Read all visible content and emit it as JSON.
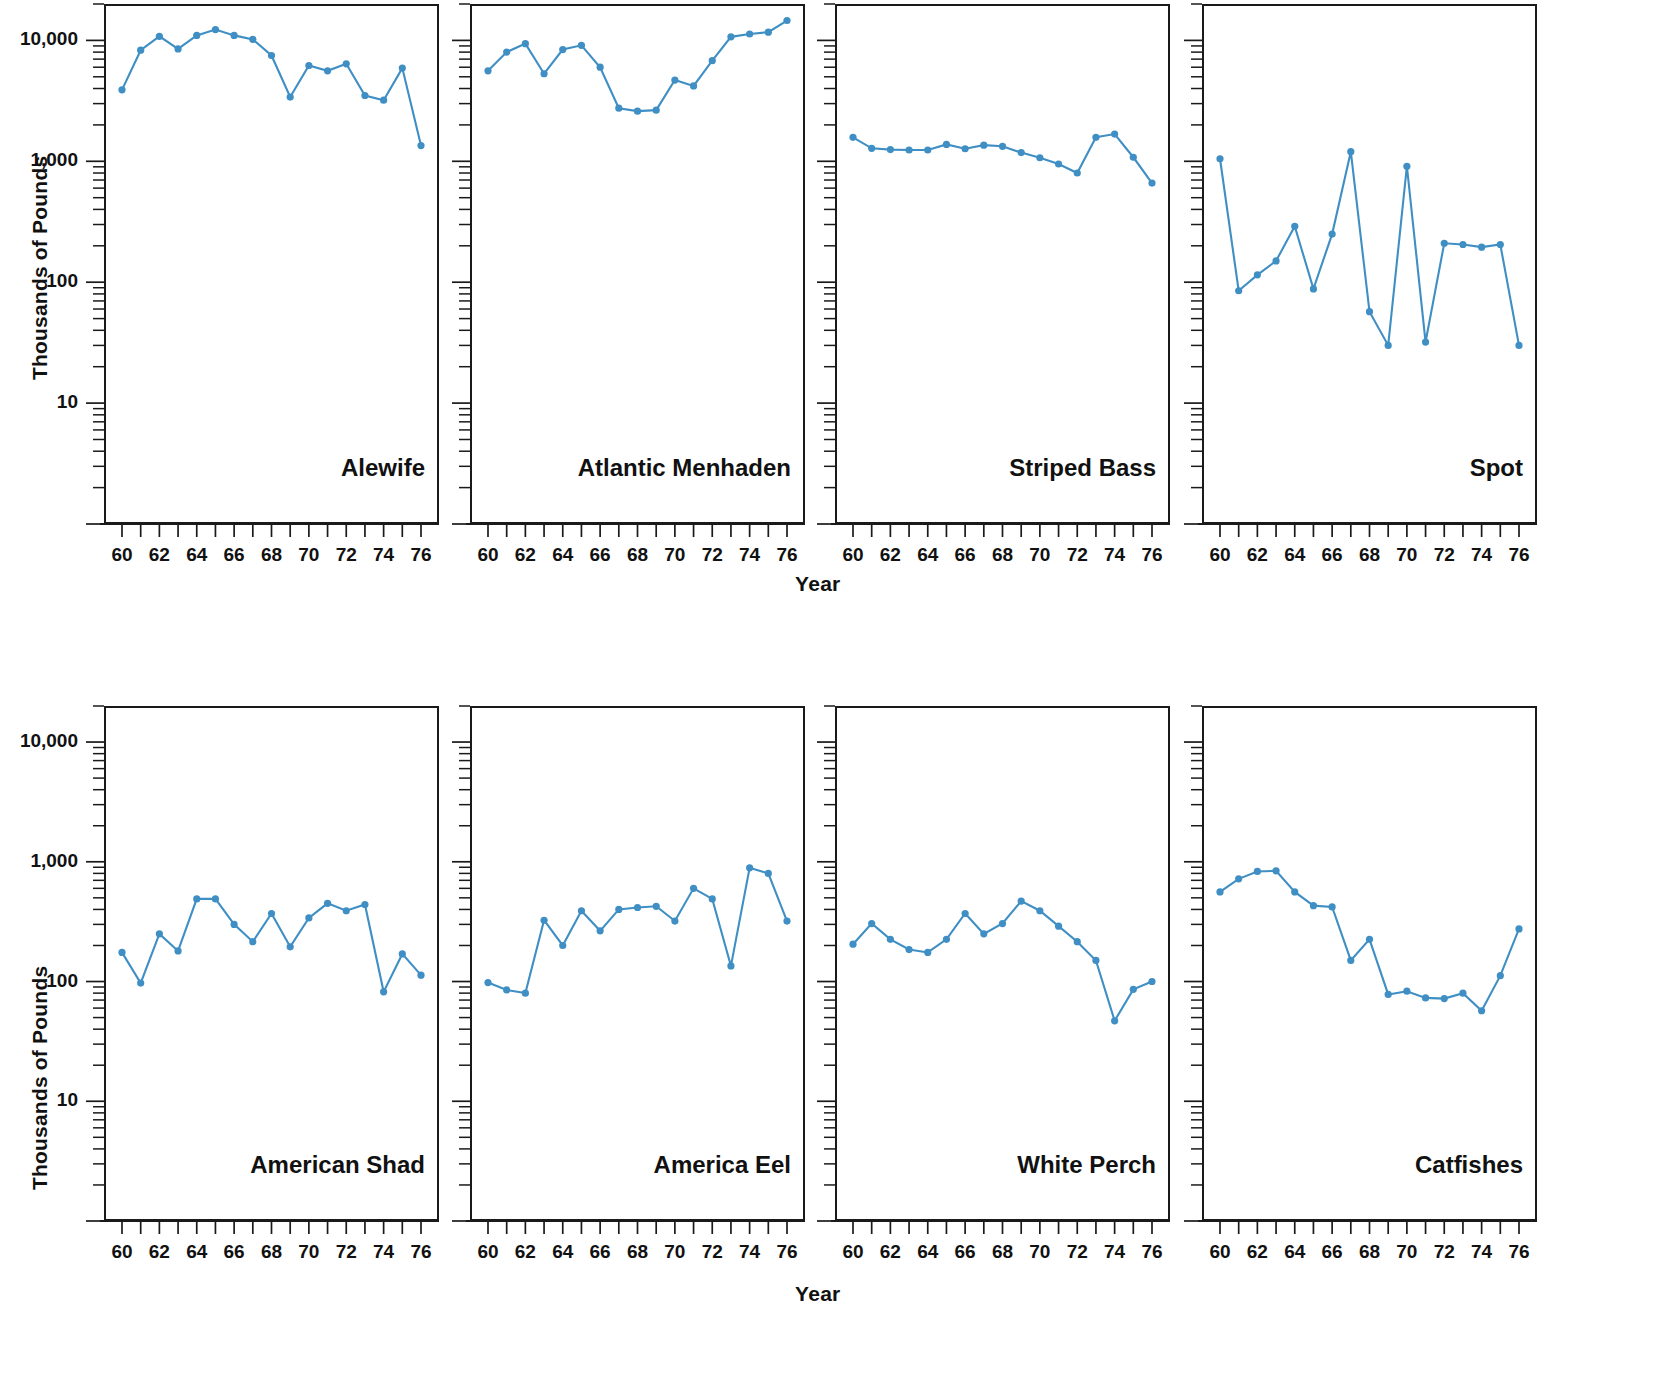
{
  "figure": {
    "ylabel": "Thousands of Pounds",
    "xlabel": "Year",
    "accent_color": "#3f8fc4",
    "axis_color": "#1a1a1a",
    "background": "#ffffff"
  },
  "axes": {
    "y_major_labels": [
      "10,000",
      "1,000",
      "100",
      "10"
    ],
    "y_major_values": [
      10000,
      1000,
      100,
      10
    ],
    "y_scale": "log",
    "y_min": 1,
    "y_max": 20000,
    "x_min": 60,
    "x_max": 76,
    "x_tick_values": [
      60,
      61,
      62,
      63,
      64,
      65,
      66,
      67,
      68,
      69,
      70,
      71,
      72,
      73,
      74,
      75,
      76
    ],
    "x_tick_labels": [
      "60",
      "",
      "62",
      "",
      "64",
      "",
      "66",
      "",
      "68",
      "",
      "70",
      "",
      "72",
      "",
      "74",
      "",
      "76"
    ],
    "x_labeled": [
      "60",
      "62",
      "64",
      "66",
      "68",
      "70",
      "72",
      "74",
      "76"
    ]
  },
  "chart_data": {
    "type": "line",
    "title": "",
    "xlabel": "Year",
    "ylabel": "Thousands of Pounds",
    "yscale": "log",
    "ylim": [
      1,
      20000
    ],
    "xlim": [
      60,
      76
    ],
    "grid": false,
    "legend": "none",
    "x": [
      60,
      61,
      62,
      63,
      64,
      65,
      66,
      67,
      68,
      69,
      70,
      71,
      72,
      73,
      74,
      75,
      76
    ],
    "panels": [
      {
        "name": "Alewife",
        "row": 0,
        "col": 0,
        "values": [
          3900,
          8300,
          10800,
          8500,
          11000,
          12300,
          11000,
          10200,
          7500,
          3400,
          6200,
          5600,
          6400,
          3500,
          3200,
          5900,
          1350
        ]
      },
      {
        "name": "Atlantic Menhaden",
        "row": 0,
        "col": 1,
        "values": [
          5600,
          8000,
          9400,
          5300,
          8400,
          9100,
          6000,
          2750,
          2600,
          2650,
          4700,
          4200,
          6800,
          10700,
          11300,
          11700,
          14600
        ]
      },
      {
        "name": "Striped Bass",
        "row": 0,
        "col": 2,
        "values": [
          1580,
          1280,
          1250,
          1240,
          1240,
          1380,
          1270,
          1360,
          1330,
          1180,
          1070,
          950,
          800,
          1580,
          1680,
          1080,
          660
        ]
      },
      {
        "name": "Spot",
        "row": 0,
        "col": 3,
        "values": [
          1050,
          85,
          115,
          150,
          290,
          88,
          250,
          1200,
          57,
          30,
          910,
          32,
          210,
          205,
          195,
          205,
          30
        ]
      },
      {
        "name": "American Shad",
        "row": 1,
        "col": 0,
        "values": [
          175,
          97,
          250,
          180,
          490,
          490,
          300,
          215,
          370,
          195,
          340,
          450,
          390,
          440,
          82,
          170,
          113
        ]
      },
      {
        "name": "America Eel",
        "row": 1,
        "col": 1,
        "values": [
          98,
          85,
          80,
          325,
          200,
          390,
          265,
          400,
          415,
          425,
          320,
          600,
          490,
          135,
          890,
          800,
          320
        ]
      },
      {
        "name": "White Perch",
        "row": 1,
        "col": 2,
        "values": [
          205,
          305,
          225,
          185,
          175,
          225,
          370,
          250,
          305,
          470,
          390,
          290,
          215,
          150,
          47,
          86,
          100
        ]
      },
      {
        "name": "Catfishes",
        "row": 1,
        "col": 3,
        "values": [
          560,
          720,
          830,
          840,
          560,
          430,
          420,
          150,
          225,
          78,
          83,
          73,
          72,
          80,
          57,
          112,
          275
        ]
      }
    ]
  }
}
